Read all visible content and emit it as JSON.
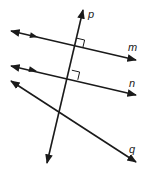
{
  "diagram": {
    "type": "geometry-lines",
    "colors": {
      "stroke": "#1a1a1a",
      "background": "#ffffff"
    },
    "lines": [
      {
        "id": "p",
        "label": "p",
        "x1": 47,
        "y1": 163,
        "x2": 83,
        "y2": 10,
        "label_x": 88,
        "label_y": 18
      },
      {
        "id": "m",
        "label": "m",
        "x1": 11,
        "y1": 31,
        "x2": 136,
        "y2": 60,
        "label_x": 128,
        "label_y": 51,
        "parallel_marker": {
          "x": 34,
          "y": 36
        }
      },
      {
        "id": "n",
        "label": "n",
        "x1": 11,
        "y1": 66,
        "x2": 136,
        "y2": 95,
        "label_x": 129,
        "label_y": 87,
        "parallel_marker": {
          "x": 33,
          "y": 70
        }
      },
      {
        "id": "q",
        "label": "q",
        "x1": 11,
        "y1": 81,
        "x2": 136,
        "y2": 162,
        "label_x": 129,
        "label_y": 153
      }
    ],
    "right_angles": [
      {
        "at": "p-m",
        "x": 75,
        "y": 46
      },
      {
        "at": "p-n",
        "x": 70,
        "y": 78
      }
    ]
  }
}
